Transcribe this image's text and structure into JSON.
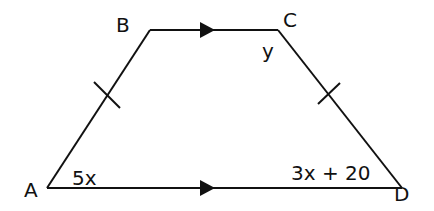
{
  "diagram": {
    "type": "trapezium",
    "stroke_color": "#111111",
    "background": "#ffffff",
    "vertices": [
      {
        "label": "A",
        "x": 47,
        "y": 188
      },
      {
        "label": "B",
        "x": 150,
        "y": 30
      },
      {
        "label": "C",
        "x": 278,
        "y": 30
      },
      {
        "label": "D",
        "x": 402,
        "y": 188
      }
    ],
    "vertex_labels": {
      "A": "A",
      "B": "B",
      "C": "C",
      "D": "D"
    },
    "angle_labels": {
      "A": "5x",
      "C": "y",
      "D": "3x + 20"
    },
    "parallel_sides": [
      "BC",
      "AD"
    ],
    "equal_sides": [
      "AB",
      "CD"
    ]
  }
}
